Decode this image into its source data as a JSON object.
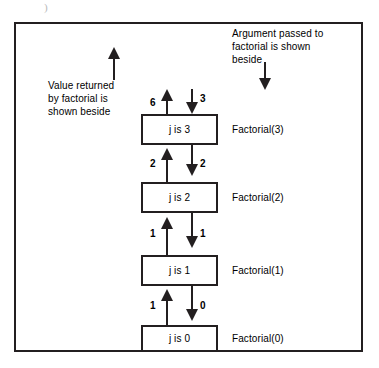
{
  "figure": {
    "artifact_mark": ")",
    "frame_color": "#231f20",
    "background": "#ffffff"
  },
  "annotations": {
    "left": {
      "name": "value-returned-note",
      "lines": [
        "Value returned",
        "by factorial is",
        "shown beside"
      ],
      "arrow": "up-arrow"
    },
    "right": {
      "name": "argument-passed-note",
      "lines": [
        "Argument passed to",
        "factorial is shown",
        "beside"
      ],
      "arrow": "down-arrow"
    }
  },
  "stack": {
    "frames": [
      {
        "box_text": "j is 3",
        "call_label": "Factorial(3)"
      },
      {
        "box_text": "j is 2",
        "call_label": "Factorial(2)"
      },
      {
        "box_text": "j is 1",
        "call_label": "Factorial(1)"
      },
      {
        "box_text": "j is 0",
        "call_label": "Factorial(0)"
      }
    ],
    "edges": [
      {
        "returned_value": "6",
        "argument": "3"
      },
      {
        "returned_value": "2",
        "argument": "2"
      },
      {
        "returned_value": "1",
        "argument": "1"
      },
      {
        "returned_value": "1",
        "argument": "0"
      }
    ]
  }
}
